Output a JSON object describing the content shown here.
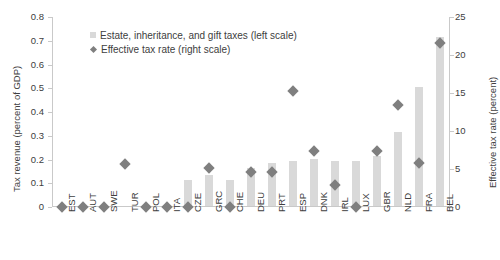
{
  "chart_data": {
    "type": "bar",
    "title": "",
    "xlabel": "",
    "ylabel": "Tax revenue (percent of GDP)",
    "ylabel_right": "Effective tax rate (percent)",
    "ylim": [
      0,
      0.8
    ],
    "ylim_right": [
      0,
      25
    ],
    "yticks": [
      "0",
      "0.1",
      "0.2",
      "0.3",
      "0.4",
      "0.5",
      "0.6",
      "0.7",
      "0.8"
    ],
    "yticks_right": [
      "0",
      "5",
      "10",
      "15",
      "20",
      "25"
    ],
    "grid": false,
    "legend_position": "upper-left-inside",
    "categories": [
      "EST",
      "AUT",
      "SWE",
      "TUR",
      "POL",
      "ITA",
      "CZE",
      "GRC",
      "CHE",
      "DEU",
      "PRT",
      "ESP",
      "DNK",
      "IRL",
      "LUX",
      "GBR",
      "NLD",
      "FRA",
      "BEL"
    ],
    "series": [
      {
        "name": "Estate, inheritance, and gift taxes (left scale)",
        "axis": "left",
        "type": "bar",
        "color": "#d9d9d9",
        "values": [
          0.0,
          0.0,
          0.0,
          0.0,
          0.0,
          0.0,
          0.11,
          0.13,
          0.11,
          0.16,
          0.18,
          0.19,
          0.2,
          0.19,
          0.19,
          0.21,
          0.31,
          0.5,
          0.71
        ]
      },
      {
        "name": "Effective tax rate (right scale)",
        "axis": "right",
        "type": "scatter",
        "marker": "diamond",
        "color": "#7f7f7f",
        "values": [
          0.0,
          0.0,
          0.0,
          5.6,
          0.0,
          0.0,
          0.0,
          5.1,
          0.0,
          4.6,
          4.6,
          15.3,
          7.4,
          2.9,
          0.0,
          7.4,
          13.4,
          5.8,
          21.6
        ]
      }
    ]
  },
  "legend": {
    "items": [
      {
        "label": "Estate, inheritance, and gift taxes (left scale)",
        "swatch": "bar-swatch"
      },
      {
        "label": "Effective tax rate (right scale)",
        "swatch": "diamond-marker"
      }
    ]
  }
}
